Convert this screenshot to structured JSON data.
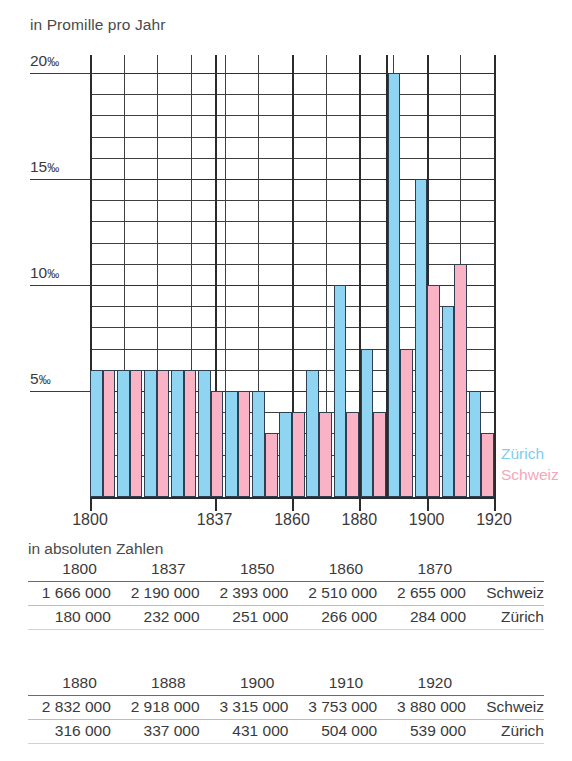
{
  "chart_data": {
    "type": "bar",
    "title": "",
    "ylabel": "in Promille pro Jahr",
    "xlabel": "",
    "ylim": [
      0,
      21
    ],
    "grid": true,
    "legend_position": "right",
    "y_ticks": [
      "20‰",
      "15‰",
      "10‰",
      "5‰"
    ],
    "y_tick_values": [
      20,
      15,
      10,
      5
    ],
    "x_ticks": [
      "1800",
      "1837",
      "1860",
      "1880",
      "1900",
      "1920"
    ],
    "x_tick_values": [
      1800,
      1837,
      1860,
      1880,
      1900,
      1920
    ],
    "series": [
      {
        "name": "Zürich",
        "color": "#8fd4f0",
        "values": [
          6,
          6,
          6,
          6,
          6,
          5,
          5,
          4,
          6,
          10,
          7,
          20,
          15,
          9,
          5
        ]
      },
      {
        "name": "Schweiz",
        "color": "#f9b3c4",
        "values": [
          6,
          6,
          6,
          6,
          5,
          5,
          3,
          4,
          4,
          4,
          4,
          7,
          10,
          11,
          3
        ]
      }
    ]
  },
  "header": {
    "axis_caption": "in Promille pro Jahr"
  },
  "legend": {
    "zurich": "Zürich",
    "schweiz": "Schweiz",
    "zurich_color": "#7ecdec",
    "schweiz_color": "#f6a6bb"
  },
  "tables": {
    "caption": "in absoluten Zahlen",
    "table1": {
      "years": [
        "1800",
        "1837",
        "1850",
        "1860",
        "1870"
      ],
      "rows": [
        {
          "label": "Schweiz",
          "values": [
            "1 666 000",
            "2 190 000",
            "2 393 000",
            "2 510 000",
            "2 655 000"
          ]
        },
        {
          "label": "Zürich",
          "values": [
            "180 000",
            "232 000",
            "251 000",
            "266 000",
            "284 000"
          ]
        }
      ]
    },
    "table2": {
      "years": [
        "1880",
        "1888",
        "1900",
        "1910",
        "1920"
      ],
      "rows": [
        {
          "label": "Schweiz",
          "values": [
            "2 832 000",
            "2 918 000",
            "3 315 000",
            "3 753 000",
            "3 880 000"
          ]
        },
        {
          "label": "Zürich",
          "values": [
            "316 000",
            "337 000",
            "431 000",
            "504 000",
            "539 000"
          ]
        }
      ]
    }
  }
}
